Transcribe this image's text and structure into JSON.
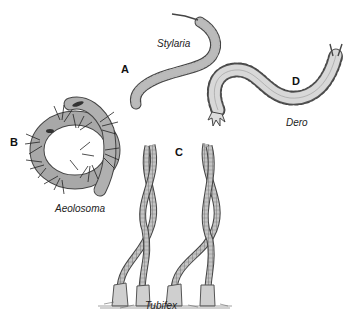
{
  "figure": {
    "panels": [
      {
        "letter": "A",
        "species": "Stylaria"
      },
      {
        "letter": "B",
        "species": "Aeolosoma"
      },
      {
        "letter": "C",
        "species": "Tubifex"
      },
      {
        "letter": "D",
        "species": "Dero"
      }
    ],
    "colors": {
      "worm_fill": "#b8b8b8",
      "worm_stroke": "#444444",
      "dero_fill": "#d8d8d8",
      "setae": "#222222",
      "background": "#ffffff"
    }
  }
}
